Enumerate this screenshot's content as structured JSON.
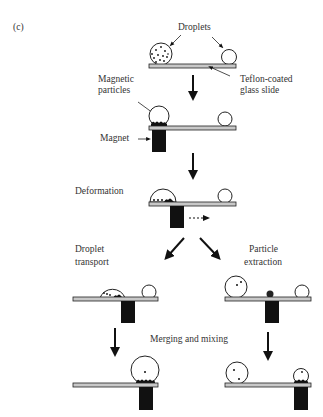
{
  "figure": {
    "panel_label": "(c)",
    "labels": {
      "droplets": "Droplets",
      "slide": [
        "Teflon-coated",
        "glass slide"
      ],
      "particles": [
        "Magnetic",
        "particles"
      ],
      "magnet": "Magnet",
      "deformation": "Deformation",
      "transport": [
        "Droplet",
        "transport"
      ],
      "extraction": [
        "Particle",
        "extraction"
      ],
      "merging": "Merging and mixing"
    }
  }
}
